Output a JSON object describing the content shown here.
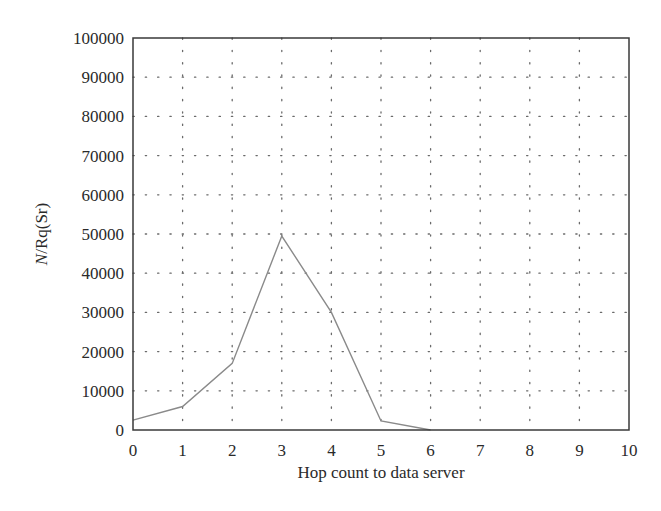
{
  "chart_data": {
    "type": "line",
    "title": "",
    "xlabel": "Hop count to data server",
    "ylabel": "N/Rq(Sr)",
    "ylabel_italic_part": "N",
    "ylabel_rest": "/Rq(Sr)",
    "xlim": [
      0,
      10
    ],
    "ylim": [
      0,
      100000
    ],
    "x_ticks": [
      0,
      1,
      2,
      3,
      4,
      5,
      6,
      7,
      8,
      9,
      10
    ],
    "x_tick_labels": [
      "0",
      "1",
      "2",
      "3",
      "4",
      "5",
      "6",
      "7",
      "8",
      "9",
      "10"
    ],
    "y_ticks": [
      0,
      10000,
      20000,
      30000,
      40000,
      50000,
      60000,
      70000,
      80000,
      90000,
      100000
    ],
    "y_tick_labels": [
      "0",
      "10000",
      "20000",
      "30000",
      "40000",
      "50000",
      "60000",
      "70000",
      "80000",
      "90000",
      "100000"
    ],
    "grid": true,
    "grid_style": "dotted",
    "legend": null,
    "series": [
      {
        "name": "N/Rq(Sr)",
        "color": "#8a8a8a",
        "x": [
          0,
          1,
          2,
          3,
          4,
          5,
          6
        ],
        "values": [
          2500,
          6000,
          17000,
          49500,
          30000,
          2300,
          0
        ]
      }
    ]
  },
  "colors": {
    "axis": "#3a3a3a",
    "grid": "#6a6a6a",
    "line": "#8a8a8a",
    "text": "#2a2a2a"
  }
}
